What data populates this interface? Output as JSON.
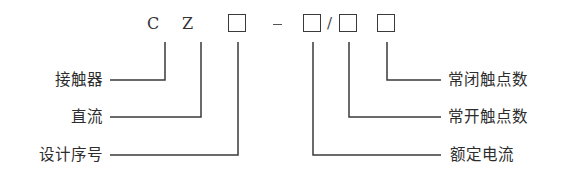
{
  "diagram": {
    "code_parts": [
      {
        "id": "c",
        "text": "C"
      },
      {
        "id": "z",
        "text": "Z"
      },
      {
        "id": "box1",
        "text": ""
      },
      {
        "id": "dash",
        "text": "-"
      },
      {
        "id": "box2",
        "text": ""
      },
      {
        "id": "slash",
        "text": "/"
      },
      {
        "id": "box3",
        "text": ""
      },
      {
        "id": "box4",
        "text": ""
      }
    ],
    "left_labels": {
      "contactor": "接触器",
      "dc": "直流",
      "design_serial": "设计序号"
    },
    "right_labels": {
      "nc_contacts": "常闭触点数",
      "no_contacts": "常开触点数",
      "rated_current": "额定电流"
    },
    "c_letter": "C",
    "z_letter": "Z",
    "slash": "/",
    "line_color": "#3a3a3a"
  }
}
